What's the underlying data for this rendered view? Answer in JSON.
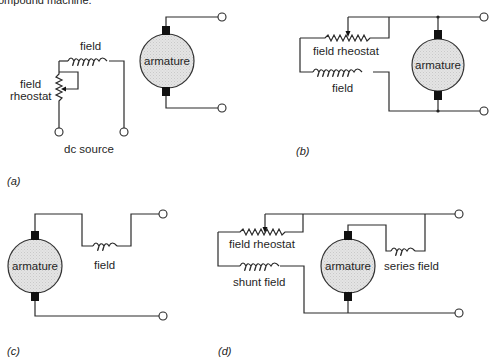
{
  "caption_fragment": "ompound machine.",
  "panels": {
    "a": {
      "sublabel": "(a)",
      "labels": {
        "field": "field",
        "rheostat_line1": "field",
        "rheostat_line2": "rheostat",
        "source": "dc source",
        "armature": "armature"
      }
    },
    "b": {
      "sublabel": "(b)",
      "labels": {
        "rheostat": "field rheostat",
        "field": "field",
        "armature": "armature"
      }
    },
    "c": {
      "sublabel": "(c)",
      "labels": {
        "field": "field",
        "armature": "armature"
      }
    },
    "d": {
      "sublabel": "(d)",
      "labels": {
        "rheostat": "field rheostat",
        "shunt_field": "shunt field",
        "series_field": "series field",
        "armature": "armature"
      }
    }
  },
  "colors": {
    "line": "#2a2a2a",
    "armature_fill": "#e2e2e2",
    "brush": "#111111",
    "background": "#ffffff"
  }
}
